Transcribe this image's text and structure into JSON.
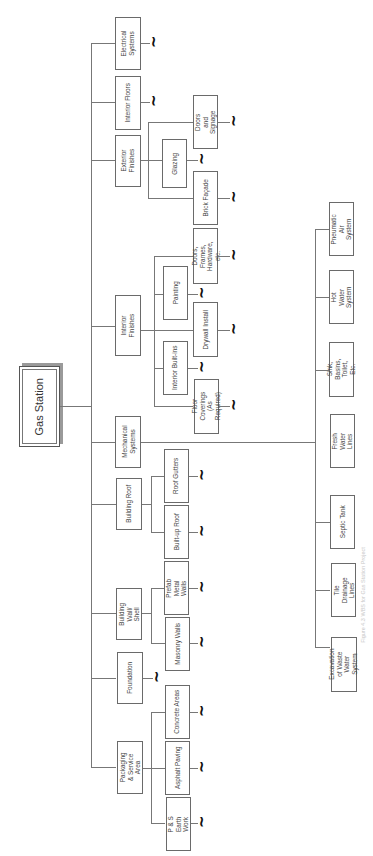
{
  "diagram": {
    "type": "work-breakdown-structure",
    "orientation": "rotated-90-ccw",
    "root": {
      "label": "Gas Station"
    },
    "level1": [
      {
        "id": "electrical",
        "label": "Electrical Systems"
      },
      {
        "id": "interior-floors",
        "label": "Interior Floors"
      },
      {
        "id": "exterior-finishes",
        "label": "Exterior Finishes"
      },
      {
        "id": "interior-finishes",
        "label": "Interior Finishes"
      },
      {
        "id": "mechanical",
        "label": "Mechanical Systems"
      },
      {
        "id": "building-roof",
        "label": "Building Roof"
      },
      {
        "id": "building-wall",
        "label": "Building Wall/ Shell"
      },
      {
        "id": "foundation",
        "label": "Foundation"
      },
      {
        "id": "packaging",
        "label": "Packaging & Service Area"
      }
    ],
    "exterior_finishes_children": [
      {
        "label": "Doors and Signage"
      },
      {
        "label": "Glazing"
      },
      {
        "label": "Brick Façade"
      }
    ],
    "interior_finishes_children": [
      {
        "label": "Doors, Frames, Hardware, etc."
      },
      {
        "label": "Painting"
      },
      {
        "label": "Drywall Install"
      },
      {
        "label": "Interior Built-ins"
      },
      {
        "label": "Floor Coverings (As Required)"
      }
    ],
    "mechanical_children": [
      {
        "label": "Pneumatic Air System"
      },
      {
        "label": "Hot Water System"
      },
      {
        "label": "Sink, Basins, Toilet, Etc."
      },
      {
        "label": "Fresh Water Lines"
      },
      {
        "label": "Septic Tank"
      },
      {
        "label": "Tile Drainage Lines"
      },
      {
        "label": "Excavation of Waste Water System"
      }
    ],
    "building_roof_children": [
      {
        "label": "Roof Gutters"
      },
      {
        "label": "Built-up Roof"
      }
    ],
    "building_wall_children": [
      {
        "label": "Prefab Metal Walls"
      },
      {
        "label": "Masonry Walls"
      }
    ],
    "packaging_children": [
      {
        "label": "Concrete Areas"
      },
      {
        "label": "Asphalt Paving"
      },
      {
        "label": "P & S Earth Work"
      }
    ],
    "continuation_symbol": "~",
    "caption": "Figure 4.3 WBS for Gas Station Project"
  }
}
